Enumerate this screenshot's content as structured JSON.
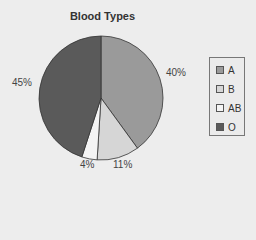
{
  "chart_data": {
    "type": "pie",
    "title": "Blood Types",
    "categories": [
      "A",
      "B",
      "AB",
      "O"
    ],
    "values": [
      40,
      11,
      4,
      45
    ],
    "labels": [
      "40%",
      "11%",
      "4%",
      "45%"
    ],
    "colors": [
      "#9a9a9a",
      "#d6d6d6",
      "#f4f4f4",
      "#5a5a5a"
    ],
    "legend_position": "right"
  },
  "title": "Blood Types",
  "legend": [
    {
      "label": "A",
      "color": "#9a9a9a"
    },
    {
      "label": "B",
      "color": "#d6d6d6"
    },
    {
      "label": "AB",
      "color": "#f4f4f4"
    },
    {
      "label": "O",
      "color": "#5a5a5a"
    }
  ],
  "labels": {
    "a": "40%",
    "b": "11%",
    "ab": "4%",
    "o": "45%"
  }
}
